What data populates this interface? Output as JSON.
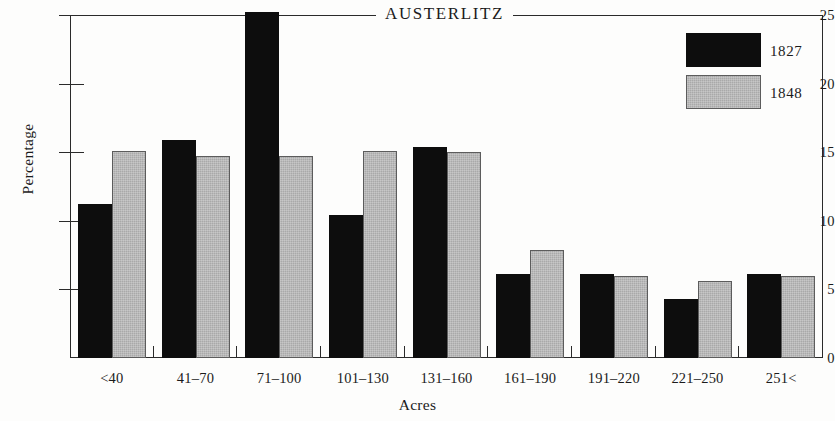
{
  "chart_data": {
    "type": "bar",
    "title": "AUSTERLITZ",
    "xlabel": "Acres",
    "ylabel": "Percentage",
    "categories": [
      "<40",
      "41–70",
      "71–100",
      "101–130",
      "131–160",
      "161–190",
      "191–220",
      "221–250",
      "251<"
    ],
    "series": [
      {
        "name": "1827",
        "color": "#0d0d0d",
        "values": [
          11.2,
          15.9,
          25.2,
          10.4,
          15.4,
          6.1,
          6.1,
          4.3,
          6.1
        ]
      },
      {
        "name": "1848",
        "color": "#a9a9a9",
        "values": [
          15.1,
          14.7,
          14.7,
          15.1,
          15.0,
          7.9,
          6.0,
          5.6,
          6.0
        ]
      }
    ],
    "ylim": [
      0,
      25
    ],
    "yticks": [
      0,
      5,
      10,
      15,
      20,
      25
    ],
    "ytick_labels": [
      "0",
      "5",
      "10",
      "15",
      "20",
      "25"
    ],
    "grid": false,
    "legend_position": "top-right"
  },
  "legend": {
    "entries": [
      {
        "label": "1827"
      },
      {
        "label": "1848"
      }
    ]
  }
}
